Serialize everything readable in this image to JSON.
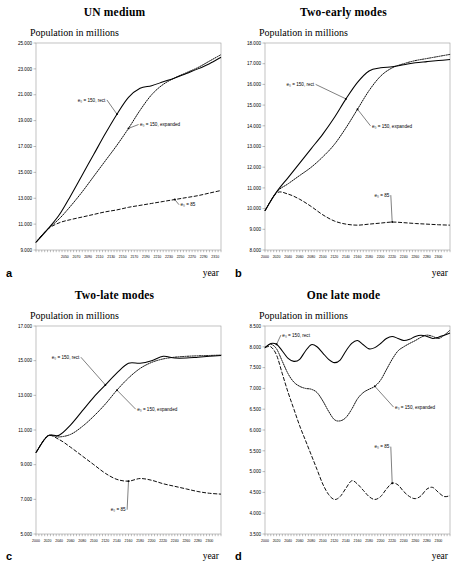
{
  "figure": {
    "axis_x_label": "year",
    "axis_y_label": "Population in millions",
    "series_labels": {
      "rect": "e₀ = 150, rect",
      "expanded": "e₀ = 150, expanded",
      "low": "e₀ = 85"
    }
  },
  "panels": [
    {
      "letter": "a",
      "title": "UN medium"
    },
    {
      "letter": "b",
      "title": "Two-early modes"
    },
    {
      "letter": "c",
      "title": "Two-late modes"
    },
    {
      "letter": "d",
      "title": "One late mode"
    }
  ],
  "chart_data": [
    {
      "type": "line",
      "panel": "a",
      "title": "UN medium",
      "xlabel": "year",
      "ylabel": "Population in millions",
      "xlim": [
        2000,
        2320
      ],
      "ylim": [
        9000,
        25000
      ],
      "yticks": [
        9000,
        11000,
        13000,
        15000,
        17000,
        19000,
        21000,
        23000,
        25000
      ],
      "ytick_labels": [
        "9.000",
        "11.000",
        "13.000",
        "15.000",
        "17.000",
        "19.000",
        "21.000",
        "23.000",
        "25.000"
      ],
      "xticks": [
        2050,
        2070,
        2090,
        2110,
        2130,
        2150,
        2170,
        2190,
        2210,
        2230,
        2250,
        2270,
        2290,
        2310
      ],
      "xtick_labels": [
        "2050",
        "2070",
        "2090",
        "2110",
        "2130",
        "2150",
        "2170",
        "2190",
        "2210",
        "2230",
        "2250",
        "2270",
        "2290",
        "2310"
      ],
      "grid": false,
      "legend": "annotations",
      "x": [
        2000,
        2020,
        2040,
        2060,
        2080,
        2100,
        2120,
        2140,
        2160,
        2180,
        2200,
        2220,
        2240,
        2260,
        2280,
        2300,
        2320
      ],
      "series": [
        {
          "name": "e₀ = 150, rect",
          "values": [
            9600,
            10600,
            11700,
            13200,
            14800,
            16400,
            18000,
            19500,
            20800,
            21500,
            21700,
            22000,
            22300,
            22650,
            23000,
            23400,
            23900
          ]
        },
        {
          "name": "e₀ = 150, expanded",
          "values": [
            9600,
            10600,
            11400,
            12400,
            13500,
            14700,
            15900,
            17100,
            18400,
            19800,
            21000,
            21800,
            22300,
            22700,
            23100,
            23600,
            24100
          ]
        },
        {
          "name": "e₀ = 85",
          "values": [
            9600,
            10600,
            11100,
            11350,
            11550,
            11750,
            11950,
            12100,
            12300,
            12450,
            12600,
            12750,
            12900,
            13050,
            13200,
            13400,
            13600
          ]
        }
      ],
      "annotations": [
        {
          "label": "e₀ = 150, rect",
          "x": 2120,
          "y": 20600
        },
        {
          "label": "e₀ = 150, expanded",
          "x": 2180,
          "y": 18700
        },
        {
          "label": "e₀ = 85",
          "x": 2250,
          "y": 12500
        }
      ]
    },
    {
      "type": "line",
      "panel": "b",
      "title": "Two-early modes",
      "xlabel": "year",
      "ylabel": "Population in millions",
      "xlim": [
        2000,
        2320
      ],
      "ylim": [
        8000,
        18000
      ],
      "yticks": [
        8000,
        9000,
        10000,
        11000,
        12000,
        13000,
        14000,
        15000,
        16000,
        17000,
        18000
      ],
      "ytick_labels": [
        "8.000",
        "9.000",
        "10.000",
        "11.000",
        "12.000",
        "13.000",
        "14.000",
        "15.000",
        "16.000",
        "17.000",
        "18.000"
      ],
      "xticks": [
        2000,
        2020,
        2040,
        2060,
        2080,
        2100,
        2120,
        2140,
        2160,
        2180,
        2200,
        2220,
        2240,
        2260,
        2280,
        2300
      ],
      "xtick_labels": [
        "2000",
        "2020",
        "2040",
        "2060",
        "2080",
        "2100",
        "2120",
        "2140",
        "2160",
        "2180",
        "2200",
        "2220",
        "2240",
        "2260",
        "2280",
        "2300"
      ],
      "grid": false,
      "legend": "annotations",
      "x": [
        2000,
        2020,
        2040,
        2060,
        2080,
        2100,
        2120,
        2140,
        2160,
        2180,
        2200,
        2220,
        2240,
        2260,
        2280,
        2300,
        2320
      ],
      "series": [
        {
          "name": "e₀ = 150, rect",
          "values": [
            9900,
            10800,
            11500,
            12200,
            12900,
            13600,
            14400,
            15300,
            16100,
            16650,
            16800,
            16850,
            16950,
            17050,
            17100,
            17150,
            17200
          ]
        },
        {
          "name": "e₀ = 150, expanded",
          "values": [
            9900,
            10800,
            11200,
            11600,
            12000,
            12500,
            13100,
            13900,
            14800,
            15700,
            16400,
            16800,
            17000,
            17150,
            17250,
            17350,
            17450
          ]
        },
        {
          "name": "e₀ = 85",
          "values": [
            9900,
            10750,
            10700,
            10450,
            10100,
            9700,
            9400,
            9250,
            9200,
            9250,
            9300,
            9350,
            9320,
            9280,
            9250,
            9220,
            9200
          ]
        }
      ],
      "annotations": [
        {
          "label": "e₀ = 150, rect",
          "x": 2085,
          "y": 16000
        },
        {
          "label": "e₀ = 150, expanded",
          "x": 2185,
          "y": 14000
        },
        {
          "label": "e₀ = 85",
          "x": 2215,
          "y": 10650
        }
      ]
    },
    {
      "type": "line",
      "panel": "c",
      "title": "Two-late modes",
      "xlabel": "year",
      "ylabel": "Population in millions",
      "xlim": [
        2000,
        2320
      ],
      "ylim": [
        5000,
        17000
      ],
      "yticks": [
        5000,
        7000,
        9000,
        11000,
        13000,
        15000,
        17000
      ],
      "ytick_labels": [
        "5.000",
        "7.000",
        "9.000",
        "11.000",
        "13.000",
        "15.000",
        "17.000"
      ],
      "xticks": [
        2000,
        2020,
        2040,
        2060,
        2080,
        2100,
        2120,
        2140,
        2160,
        2180,
        2200,
        2220,
        2240,
        2260,
        2280,
        2300
      ],
      "xtick_labels": [
        "2000",
        "2020",
        "2040",
        "2060",
        "2080",
        "2100",
        "2120",
        "2140",
        "2160",
        "2180",
        "2200",
        "2220",
        "2240",
        "2260",
        "2280",
        "2300"
      ],
      "grid": false,
      "legend": "annotations",
      "x": [
        2000,
        2020,
        2040,
        2060,
        2080,
        2100,
        2120,
        2140,
        2160,
        2180,
        2200,
        2220,
        2240,
        2260,
        2280,
        2300,
        2320
      ],
      "series": [
        {
          "name": "e₀ = 150, rect",
          "values": [
            9700,
            10650,
            10700,
            11300,
            12100,
            12900,
            13600,
            14300,
            14850,
            14850,
            15000,
            15250,
            15150,
            15150,
            15200,
            15250,
            15300
          ]
        },
        {
          "name": "e₀ = 150, expanded",
          "values": [
            9700,
            10650,
            10600,
            10750,
            11200,
            11800,
            12500,
            13300,
            14000,
            14550,
            14900,
            15100,
            15200,
            15250,
            15280,
            15300,
            15320
          ]
        },
        {
          "name": "e₀ = 85",
          "values": [
            9700,
            10650,
            10450,
            10000,
            9500,
            9000,
            8500,
            8150,
            8050,
            8200,
            8100,
            7900,
            7750,
            7600,
            7450,
            7350,
            7300
          ]
        }
      ],
      "annotations": [
        {
          "label": "e₀ = 150, rect",
          "x": 2075,
          "y": 15200
        },
        {
          "label": "e₀ = 150, expanded",
          "x": 2175,
          "y": 12200
        },
        {
          "label": "e₀ = 85",
          "x": 2155,
          "y": 6400
        }
      ]
    },
    {
      "type": "line",
      "panel": "d",
      "title": "One late mode",
      "xlabel": "year",
      "ylabel": "Population in millions",
      "xlim": [
        2000,
        2320
      ],
      "ylim": [
        3500,
        8500
      ],
      "yticks": [
        3500,
        4000,
        4500,
        5000,
        5500,
        6000,
        6500,
        7000,
        7500,
        8000,
        8500
      ],
      "ytick_labels": [
        "3.500",
        "4.000",
        "4.500",
        "5.000",
        "5.500",
        "6.000",
        "6.500",
        "7.000",
        "7.500",
        "8.000",
        "8.500"
      ],
      "xticks": [
        2000,
        2020,
        2040,
        2060,
        2080,
        2100,
        2120,
        2140,
        2160,
        2180,
        2200,
        2220,
        2240,
        2260,
        2280,
        2300
      ],
      "xtick_labels": [
        "2000",
        "2020",
        "2040",
        "2060",
        "2080",
        "2100",
        "2120",
        "2140",
        "2160",
        "2180",
        "2200",
        "2220",
        "2240",
        "2260",
        "2280",
        "2300"
      ],
      "grid": false,
      "legend": "annotations",
      "x": [
        2000,
        2010,
        2020,
        2030,
        2040,
        2050,
        2060,
        2070,
        2080,
        2090,
        2100,
        2110,
        2120,
        2130,
        2140,
        2150,
        2160,
        2170,
        2180,
        2190,
        2200,
        2210,
        2220,
        2230,
        2240,
        2250,
        2260,
        2270,
        2280,
        2290,
        2300,
        2310,
        2320
      ],
      "series": [
        {
          "name": "e₀ = 150, rect",
          "values": [
            7980,
            8080,
            8060,
            7900,
            7720,
            7650,
            7700,
            7900,
            8050,
            8000,
            7850,
            7700,
            7620,
            7680,
            7900,
            8080,
            8150,
            8050,
            7950,
            7980,
            8080,
            8200,
            8250,
            8200,
            8150,
            8180,
            8250,
            8280,
            8250,
            8200,
            8230,
            8280,
            8330
          ]
        },
        {
          "name": "e₀ = 150, expanded",
          "values": [
            7980,
            8060,
            7950,
            7650,
            7350,
            7150,
            7050,
            7000,
            6980,
            6900,
            6700,
            6450,
            6250,
            6220,
            6300,
            6500,
            6750,
            6900,
            6980,
            7050,
            7200,
            7450,
            7700,
            7900,
            8000,
            8080,
            8150,
            8230,
            8280,
            8250,
            8200,
            8280,
            8400
          ]
        },
        {
          "name": "e₀ = 85",
          "values": [
            7980,
            8000,
            7800,
            7350,
            6900,
            6500,
            6100,
            5750,
            5400,
            5050,
            4700,
            4450,
            4330,
            4400,
            4600,
            4780,
            4700,
            4550,
            4400,
            4330,
            4400,
            4580,
            4720,
            4680,
            4520,
            4400,
            4350,
            4420,
            4580,
            4620,
            4500,
            4400,
            4420
          ]
        }
      ],
      "annotations": [
        {
          "label": "e₀ = 150, rect",
          "x": 2030,
          "y": 8280
        },
        {
          "label": "e₀ = 150, expanded",
          "x": 2225,
          "y": 6550
        },
        {
          "label": "e₀ = 85",
          "x": 2215,
          "y": 5600
        }
      ]
    }
  ]
}
